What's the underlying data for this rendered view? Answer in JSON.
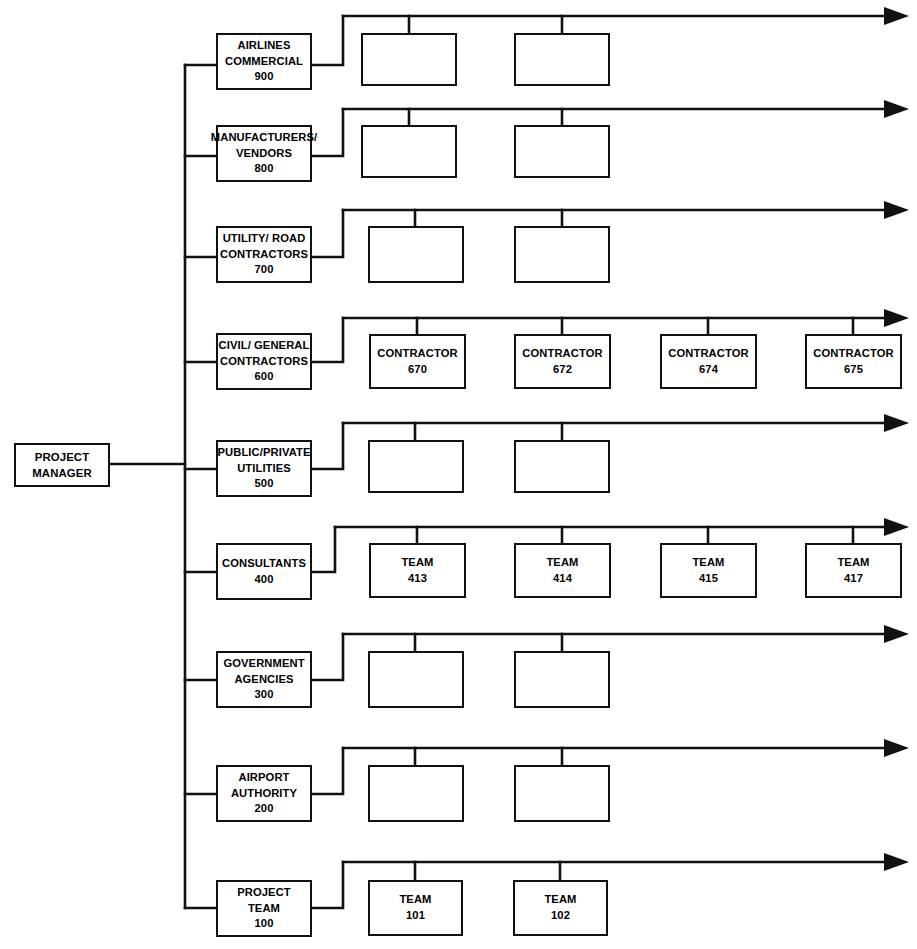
{
  "diagram": {
    "type": "organizational-chart",
    "orientation": "horizontal-left-root",
    "line_color": "#111111",
    "background_color": "#ffffff",
    "root": {
      "line1": "PROJECT",
      "line2": "MANAGER"
    },
    "branches": [
      {
        "id": "airlines-commercial",
        "line1": "AIRLINES",
        "line2": "COMMERCIAL",
        "code": "900",
        "children": [
          {
            "id": "airlines-child-1",
            "line1": "",
            "code": ""
          },
          {
            "id": "airlines-child-2",
            "line1": "",
            "code": ""
          }
        ]
      },
      {
        "id": "manufacturers-vendors",
        "line1": "MANUFACTURERS/",
        "line2": "VENDORS",
        "code": "800",
        "children": [
          {
            "id": "manufacturers-child-1",
            "line1": "",
            "code": ""
          },
          {
            "id": "manufacturers-child-2",
            "line1": "",
            "code": ""
          }
        ]
      },
      {
        "id": "utility-road-contractors",
        "line1": "UTILITY/ ROAD",
        "line2": "CONTRACTORS",
        "code": "700",
        "children": [
          {
            "id": "utility-child-1",
            "line1": "",
            "code": ""
          },
          {
            "id": "utility-child-2",
            "line1": "",
            "code": ""
          }
        ]
      },
      {
        "id": "civil-general-contractors",
        "line1": "CIVIL/ GENERAL",
        "line2": "CONTRACTORS",
        "code": "600",
        "children": [
          {
            "id": "contractor-670",
            "line1": "CONTRACTOR",
            "code": "670"
          },
          {
            "id": "contractor-672",
            "line1": "CONTRACTOR",
            "code": "672"
          },
          {
            "id": "contractor-674",
            "line1": "CONTRACTOR",
            "code": "674"
          },
          {
            "id": "contractor-675",
            "line1": "CONTRACTOR",
            "code": "675"
          }
        ]
      },
      {
        "id": "public-private-utilities",
        "line1": "PUBLIC/PRIVATE",
        "line2": "UTILITIES",
        "code": "500",
        "children": [
          {
            "id": "public-utilities-child-1",
            "line1": "",
            "code": ""
          },
          {
            "id": "public-utilities-child-2",
            "line1": "",
            "code": ""
          }
        ]
      },
      {
        "id": "consultants",
        "line1": "CONSULTANTS",
        "line2": "",
        "code": "400",
        "children": [
          {
            "id": "team-413",
            "line1": "TEAM",
            "code": "413"
          },
          {
            "id": "team-414",
            "line1": "TEAM",
            "code": "414"
          },
          {
            "id": "team-415",
            "line1": "TEAM",
            "code": "415"
          },
          {
            "id": "team-417",
            "line1": "TEAM",
            "code": "417"
          }
        ]
      },
      {
        "id": "government-agencies",
        "line1": "GOVERNMENT",
        "line2": "AGENCIES",
        "code": "300",
        "children": [
          {
            "id": "government-child-1",
            "line1": "",
            "code": ""
          },
          {
            "id": "government-child-2",
            "line1": "",
            "code": ""
          }
        ]
      },
      {
        "id": "airport-authority",
        "line1": "AIRPORT",
        "line2": "AUTHORITY",
        "code": "200",
        "children": [
          {
            "id": "airport-child-1",
            "line1": "",
            "code": ""
          },
          {
            "id": "airport-child-2",
            "line1": "",
            "code": ""
          }
        ]
      },
      {
        "id": "project-team",
        "line1": "PROJECT",
        "line2": "TEAM",
        "code": "100",
        "children": [
          {
            "id": "team-101",
            "line1": "TEAM",
            "code": "101"
          },
          {
            "id": "team-102",
            "line1": "TEAM",
            "code": "102"
          }
        ]
      }
    ]
  }
}
